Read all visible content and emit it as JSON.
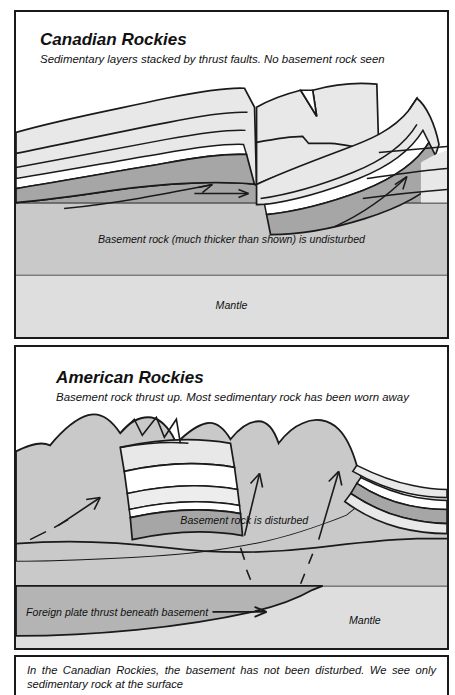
{
  "document": {
    "type": "geological-cross-section-figure",
    "panel_count": 2
  },
  "panels": [
    {
      "id": "canadian-rockies",
      "title": "Canadian Rockies",
      "subtitle": "Sedimentary layers stacked by thrust faults. No basement rock seen",
      "labels": {
        "basement": "Basement rock (much thicker than shown) is undisturbed",
        "mantle": "Mantle"
      }
    },
    {
      "id": "american-rockies",
      "title": "American Rockies",
      "subtitle": "Basement rock thrust up. Most sedimentary rock has been worn away",
      "labels": {
        "basement": "Basement rock is disturbed",
        "foreign_plate": "Foreign plate thrust beneath basement",
        "mantle": "Mantle"
      }
    }
  ],
  "caption": {
    "line1": "In the Canadian Rockies, the basement has not been disturbed. We see only",
    "line2": "sedimentary rock at the surface"
  },
  "colors": {
    "ink": "#1a1a1a",
    "white": "#ffffff",
    "sediment_light": "#e8e8e8",
    "sediment_mid": "#d0d0d0",
    "sediment_dark": "#a6a6a6",
    "basement": "#c9c9c9",
    "mantle": "#dedede",
    "foreign_plate": "#b4b4b4"
  }
}
